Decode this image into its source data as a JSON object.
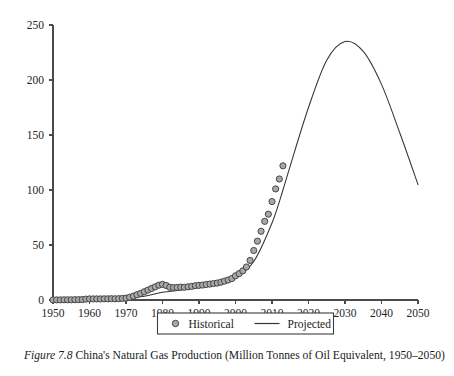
{
  "figure": {
    "caption_label": "Figure 7.8",
    "caption_text": "China's Natural Gas Production (Million Tonnes of Oil Equivalent, 1950–2050)"
  },
  "legend": {
    "position": "below-axis-center",
    "entries": [
      {
        "label": "Historical",
        "marker": "circle",
        "color": "#a8a8a8"
      },
      {
        "label": "Projected",
        "marker": "line",
        "color": "#333333"
      }
    ]
  },
  "colors": {
    "marker_fill": "#a8a8a8",
    "marker_stroke": "#3a3a3a",
    "line": "#333333",
    "axis": "#4a4a4a",
    "text": "#1a1a1a",
    "background": "#ffffff"
  },
  "chart_data": {
    "type": "line",
    "title": "China's Natural Gas Production (Million Tonnes of Oil Equivalent, 1950–2050)",
    "xlabel": "",
    "ylabel": "",
    "xlim": [
      1950,
      2050
    ],
    "ylim": [
      0,
      250
    ],
    "xticks": [
      1950,
      1960,
      1970,
      1980,
      1990,
      2000,
      2010,
      2020,
      2030,
      2040,
      2050
    ],
    "yticks": [
      0,
      50,
      100,
      150,
      200,
      250
    ],
    "xtick_labels": [
      "1950",
      "1960",
      "1970",
      "1980",
      "1990",
      "2000",
      "2010",
      "2020",
      "2030",
      "2040",
      "2050"
    ],
    "ytick_labels": [
      "0",
      "50",
      "100",
      "150",
      "200",
      "250"
    ],
    "grid": false,
    "legend_position": "bottom",
    "series": [
      {
        "name": "Historical",
        "type": "scatter",
        "marker": "circle",
        "x": [
          1950,
          1951,
          1952,
          1953,
          1954,
          1955,
          1956,
          1957,
          1958,
          1959,
          1960,
          1961,
          1962,
          1963,
          1964,
          1965,
          1966,
          1967,
          1968,
          1969,
          1970,
          1971,
          1972,
          1973,
          1974,
          1975,
          1976,
          1977,
          1978,
          1979,
          1980,
          1981,
          1982,
          1983,
          1984,
          1985,
          1986,
          1987,
          1988,
          1989,
          1990,
          1991,
          1992,
          1993,
          1994,
          1995,
          1996,
          1997,
          1998,
          1999,
          2000,
          2001,
          2002,
          2003,
          2004,
          2005,
          2006,
          2007,
          2008,
          2009,
          2010,
          2011,
          2012,
          2013
        ],
        "y": [
          0.1,
          0.1,
          0.1,
          0.2,
          0.2,
          0.2,
          0.3,
          0.3,
          0.4,
          0.8,
          1.0,
          1.0,
          1.0,
          1.0,
          1.1,
          1.1,
          1.2,
          1.1,
          1.2,
          1.4,
          1.7,
          2.5,
          3.5,
          4.8,
          6.0,
          7.5,
          9.0,
          10.5,
          12.0,
          13.5,
          14.2,
          13.2,
          11.6,
          11.3,
          11.4,
          11.7,
          11.6,
          12.0,
          12.4,
          13.0,
          13.3,
          13.6,
          14.1,
          14.5,
          15.0,
          15.4,
          16.2,
          17.2,
          18.2,
          19.5,
          22.0,
          24.0,
          26.5,
          30.0,
          36.0,
          45.0,
          53.5,
          62.5,
          71.5,
          78.0,
          89.5,
          101.0,
          110.0,
          122.0
        ],
        "units": "Million tonnes of oil equivalent"
      },
      {
        "name": "Projected",
        "type": "line",
        "x": [
          1950,
          1960,
          1970,
          1975,
          1980,
          1985,
          1990,
          1995,
          2000,
          2005,
          2010,
          2013,
          2015,
          2020,
          2025,
          2030,
          2035,
          2040,
          2045,
          2050
        ],
        "y": [
          0.2,
          0.6,
          1.5,
          3.5,
          7.0,
          9.0,
          11.5,
          14.5,
          20.0,
          35.0,
          70.0,
          100.0,
          122.0,
          175.0,
          218.0,
          235.0,
          226.0,
          196.0,
          152.0,
          105.0
        ],
        "peak": {
          "year": 2030,
          "value": 235
        },
        "endpoint": {
          "year": 2050,
          "value": 105
        },
        "units": "Million tonnes of oil equivalent"
      }
    ]
  }
}
